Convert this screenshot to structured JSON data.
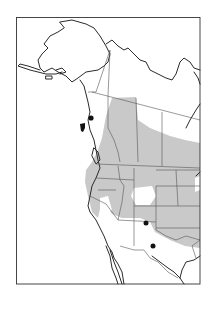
{
  "map": {
    "type": "species-range-map",
    "region": "Western North America",
    "colors": {
      "range_fill": "#c9c9c9",
      "coastline": "#2a2a2a",
      "border": "#555555",
      "record_dot": "#111111",
      "background": "#ffffff"
    },
    "legend": {
      "shaded_area": "breeding range",
      "dots": "isolated records"
    },
    "isolated_records": [
      {
        "label": "Coastal British Columbia (island)",
        "x": 82,
        "y": 126
      },
      {
        "label": "Coastal British Columbia (mainland)",
        "x": 91,
        "y": 118
      },
      {
        "label": "Colorado/New Mexico border",
        "x": 146,
        "y": 223
      },
      {
        "label": "Southern New Mexico",
        "x": 153,
        "y": 246
      }
    ]
  }
}
